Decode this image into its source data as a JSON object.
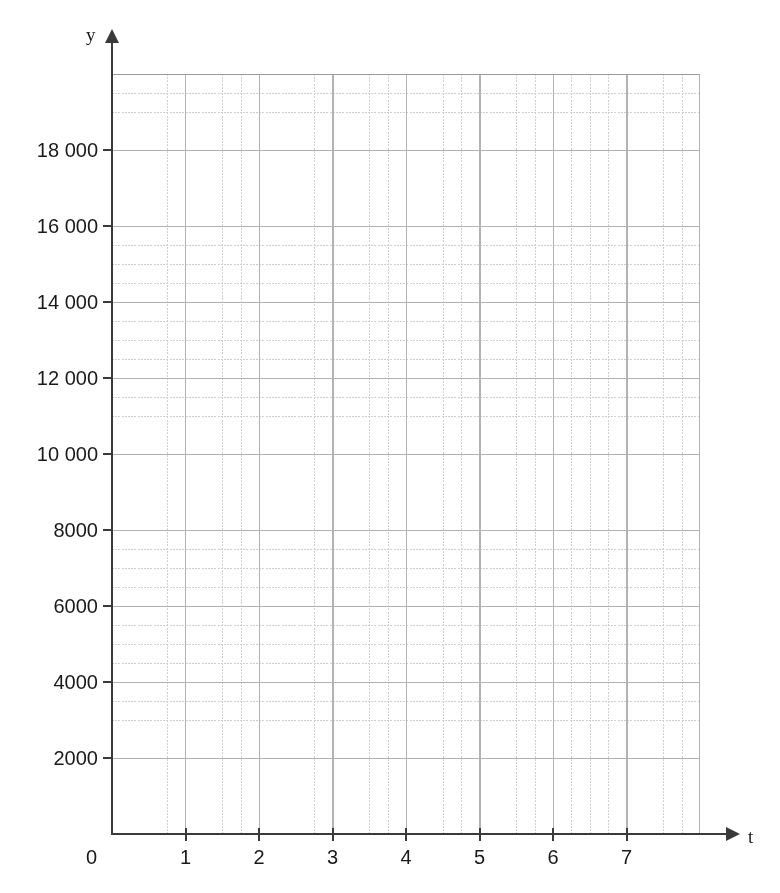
{
  "chart_data": {
    "type": "grid",
    "title": "",
    "xlabel": "t",
    "ylabel": "y",
    "xlim": [
      0,
      8
    ],
    "ylim": [
      0,
      20000
    ],
    "grid": true,
    "legend": null,
    "series": [],
    "x_ticks": [
      {
        "value": 1,
        "label": "1"
      },
      {
        "value": 2,
        "label": "2"
      },
      {
        "value": 3,
        "label": "3"
      },
      {
        "value": 4,
        "label": "4"
      },
      {
        "value": 5,
        "label": "5"
      },
      {
        "value": 6,
        "label": "6"
      },
      {
        "value": 7,
        "label": "7"
      }
    ],
    "y_ticks": [
      {
        "value": 2000,
        "label": "2000"
      },
      {
        "value": 4000,
        "label": "4000"
      },
      {
        "value": 6000,
        "label": "6000"
      },
      {
        "value": 8000,
        "label": "8000"
      },
      {
        "value": 10000,
        "label": "10 000"
      },
      {
        "value": 12000,
        "label": "12 000"
      },
      {
        "value": 14000,
        "label": "14 000"
      },
      {
        "value": 16000,
        "label": "16 000"
      },
      {
        "value": 18000,
        "label": "18 000"
      }
    ],
    "x_minor_per_major": 4,
    "y_minor_per_major": 4,
    "values": [],
    "categories": []
  },
  "axes": {
    "origin_label": "0",
    "y_axis_name": "y",
    "x_axis_name": "t"
  },
  "colors": {
    "background": "#ffffff",
    "axis": "#3a3a3a",
    "grid_major": "#b3b3b3",
    "grid_minor": "#cfcfcf",
    "text": "#1a1a1a"
  }
}
